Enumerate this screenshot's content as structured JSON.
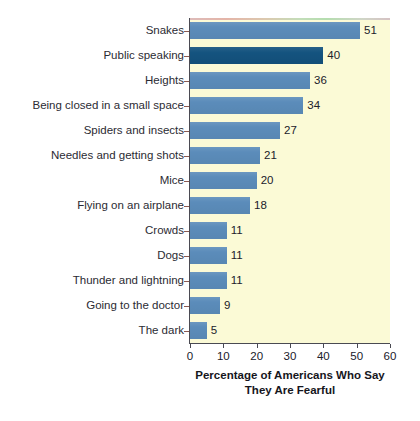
{
  "chart_data": {
    "type": "bar",
    "orientation": "horizontal",
    "title": "",
    "subtitle": "",
    "xlabel": "Percentage of Americans Who Say They Are Fearful",
    "xlabel_lines": [
      "Percentage of Americans Who Say",
      "They Are Fearful"
    ],
    "ylabel": "",
    "categories": [
      "Snakes",
      "Public speaking",
      "Heights",
      "Being closed in a small space",
      "Spiders and insects",
      "Needles and getting shots",
      "Mice",
      "Flying on an airplane",
      "Crowds",
      "Dogs",
      "Thunder and lightning",
      "Going to the doctor",
      "The dark"
    ],
    "values": [
      51,
      40,
      36,
      34,
      27,
      21,
      20,
      18,
      11,
      11,
      11,
      9,
      5
    ],
    "value_labels": [
      "51",
      "40",
      "36",
      "34",
      "27",
      "21",
      "20",
      "18",
      "11",
      "11",
      "11",
      "9",
      "5"
    ],
    "highlighted_index": 1,
    "xlim": [
      0,
      60
    ],
    "xticks": [
      0,
      10,
      20,
      30,
      40,
      50,
      60
    ],
    "xtick_labels": [
      "0",
      "10",
      "20",
      "30",
      "40",
      "50",
      "60"
    ],
    "grid": false,
    "legend": null,
    "colors": {
      "bar": "#5b8cba",
      "bar_highlight": "#14537f",
      "plot_background": "#fbfad6",
      "figure_background": "#ffffff",
      "axis": "#4a4a52",
      "text": "#20202a"
    }
  }
}
